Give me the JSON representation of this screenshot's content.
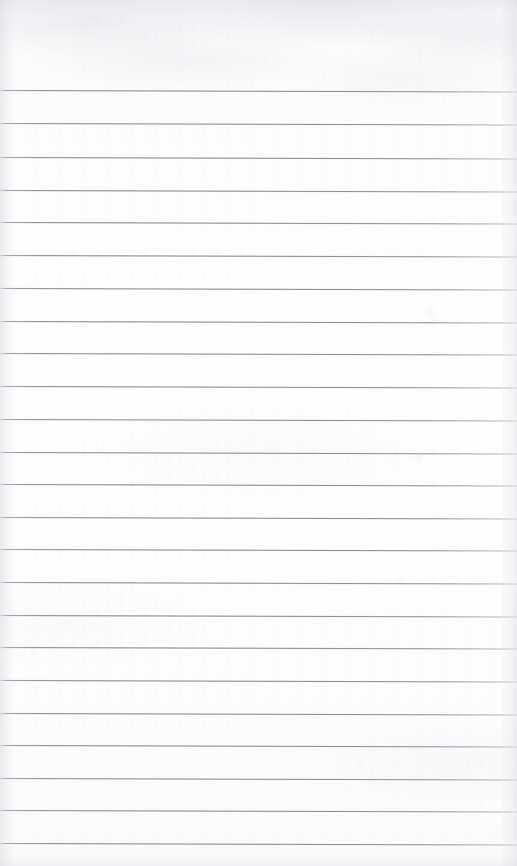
{
  "document": {
    "kind": "scanned-lined-paper",
    "description": "Blank ruled notepad page, scanned",
    "page_width": 517,
    "page_height": 866,
    "orientation": "portrait",
    "content_text": "",
    "handwriting": "none",
    "printed_text": "none"
  },
  "paper": {
    "background_color": "#fdfdfe",
    "top_margin_color": "#f7f7f9",
    "edge_shadow_color": "#c4c6cd"
  },
  "rules": {
    "line_color": "#82848e",
    "line_width_px": 1,
    "count": 24,
    "first_line_y": 90,
    "spacing_px": 32.7,
    "tilt_degrees": 0.18,
    "left_inset_px": 0,
    "right_inset_px": 0,
    "y_positions": [
      90,
      123,
      157,
      190,
      222,
      255,
      288,
      321,
      353,
      386,
      419,
      452,
      484,
      517,
      549,
      582,
      615,
      647,
      680,
      713,
      745,
      778,
      810,
      843
    ]
  },
  "regions": {
    "header_margin": {
      "top": 0,
      "height": 90,
      "label": "blank-top-margin"
    },
    "footer_margin": {
      "top": 843,
      "height": 23,
      "label": "blank-bottom-margin"
    }
  },
  "artifacts": [
    {
      "name": "faint-smudge-upper-right",
      "x": 424,
      "y": 306,
      "w": 14,
      "h": 16,
      "opacity": 0.06
    },
    {
      "name": "faint-smudge-mid-right",
      "x": 408,
      "y": 452,
      "w": 18,
      "h": 12,
      "opacity": 0.05
    },
    {
      "name": "faint-smudge-lower-right",
      "x": 392,
      "y": 575,
      "w": 16,
      "h": 14,
      "opacity": 0.045
    },
    {
      "name": "faint-speck-left",
      "x": 28,
      "y": 648,
      "w": 9,
      "h": 8,
      "opacity": 0.05
    }
  ]
}
